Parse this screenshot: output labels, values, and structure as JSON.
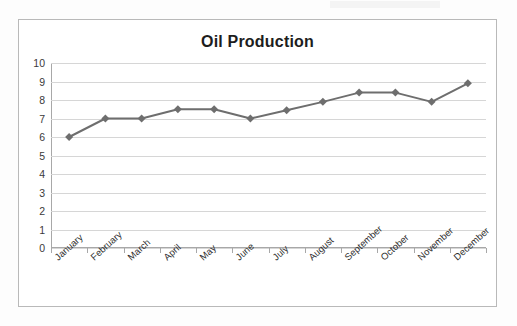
{
  "chart_data": {
    "type": "line",
    "title": "Oil Production",
    "xlabel": "",
    "ylabel": "",
    "categories": [
      "January",
      "February",
      "March",
      "April",
      "May",
      "June",
      "July",
      "August",
      "September",
      "October",
      "November",
      "December"
    ],
    "values": [
      6.0,
      7.0,
      7.0,
      7.5,
      7.5,
      7.0,
      7.45,
      7.9,
      8.4,
      8.4,
      7.9,
      8.9
    ],
    "series": [
      {
        "name": "Oil Production",
        "values": [
          6.0,
          7.0,
          7.0,
          7.5,
          7.5,
          7.0,
          7.45,
          7.9,
          8.4,
          8.4,
          7.9,
          8.9
        ]
      }
    ],
    "ylim": [
      0,
      10
    ],
    "ytick_labels": [
      "0",
      "1",
      "2",
      "3",
      "4",
      "5",
      "6",
      "7",
      "8",
      "9",
      "10"
    ],
    "ytick_values": [
      0,
      1,
      2,
      3,
      4,
      5,
      6,
      7,
      8,
      9,
      10
    ],
    "grid": true,
    "grid_axis": "y",
    "legend": false,
    "legend_position": "none",
    "marker": "diamond",
    "line_color": "#6e6e6e",
    "marker_color": "#6e6e6e",
    "grid_color": "#d6d6d6",
    "axis_color": "#a8a8a8",
    "title_color": "#1d1d1d",
    "plot_background": "#ffffff"
  }
}
